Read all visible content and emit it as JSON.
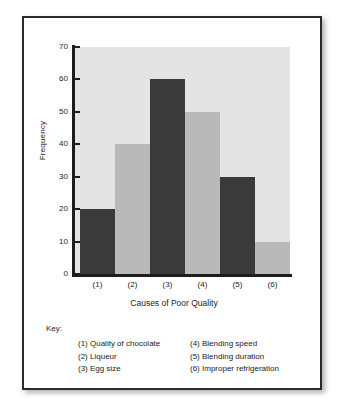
{
  "chart_data": {
    "type": "bar",
    "title": "",
    "categories": [
      "(1)",
      "(2)",
      "(3)",
      "(4)",
      "(5)",
      "(6)"
    ],
    "values": [
      20,
      40,
      60,
      50,
      30,
      10
    ],
    "bar_colors": [
      "#3a3a3a",
      "#b9b9b9",
      "#3a3a3a",
      "#b9b9b9",
      "#3a3a3a",
      "#b9b9b9"
    ],
    "xlabel": "Causes of Poor Quality",
    "ylabel": "Frequency",
    "ylim": [
      0,
      70
    ],
    "yticks": [
      0,
      10,
      20,
      30,
      40,
      50,
      60,
      70
    ],
    "grid": false,
    "legend_position": "below-plot",
    "plot_background": "#e4e4e4"
  },
  "key": {
    "title": "Key:",
    "left_column": [
      "(1) Quality of chocolate",
      "(2) Liqueur",
      "(3) Egg size"
    ],
    "right_column": [
      "(4) Blending speed",
      "(5) Blending duration",
      "(6) Improper refrigeration"
    ]
  }
}
